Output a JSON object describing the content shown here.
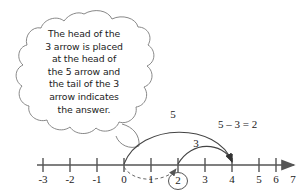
{
  "figure": {
    "kind": "number-line-subtraction-diagram",
    "background_color": "#ffffff",
    "ink_color": "#1a1a1a",
    "line_color": "#555555"
  },
  "callout": {
    "shape": "thought-cloud",
    "lines": [
      "The head of the",
      "3 arrow is placed",
      "at the head of",
      "the 5 arrow and",
      "the tail of the 3",
      "arrow indicates",
      "the answer."
    ],
    "text": "The head of the 3 arrow is placed at the head of the 5 arrow and the tail of the 3 arrow indicates the answer."
  },
  "number_line": {
    "ticks": [
      "-3",
      "-2",
      "-1",
      "0",
      "1",
      "2",
      "3",
      "4",
      "5",
      "6",
      "7"
    ],
    "tick_values": [
      -3,
      -2,
      -1,
      0,
      1,
      2,
      3,
      4,
      5,
      6,
      7
    ],
    "highlighted_tick": "2",
    "direction_arrow": "right"
  },
  "arcs": [
    {
      "name": "five-arrow",
      "label": "5",
      "from": 0,
      "to": 5,
      "style": "solid",
      "arrowhead": "to"
    },
    {
      "name": "three-arrow",
      "label": "3",
      "from": 2,
      "to": 5,
      "style": "solid",
      "arrowhead": "to"
    },
    {
      "name": "answer-arrow",
      "label": "",
      "from": 0,
      "to": 2,
      "style": "dashed",
      "arrowhead": "to"
    }
  ],
  "equation": {
    "text": "5 – 3 = 2",
    "minuend": "5",
    "subtrahend": "3",
    "result": "2"
  }
}
